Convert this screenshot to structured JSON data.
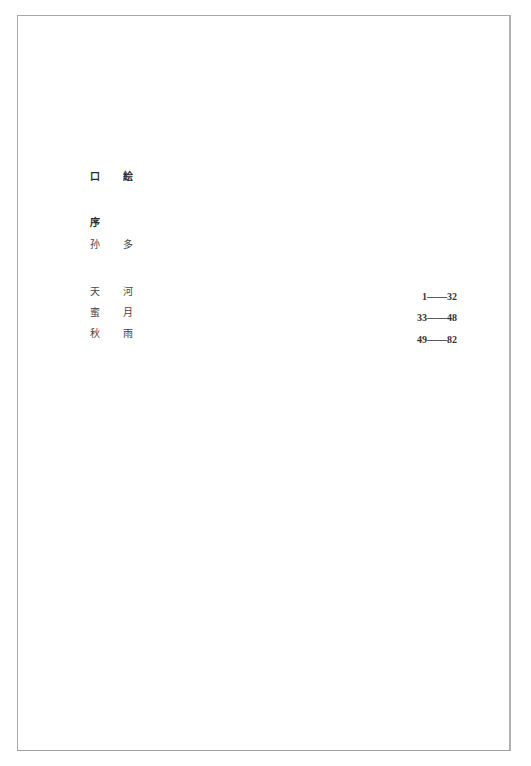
{
  "document": {
    "type": "table-of-contents",
    "front_matter": [
      {
        "label": "口 絵"
      },
      {
        "label": "序"
      },
      {
        "label": "孙 多"
      }
    ],
    "entries": [
      {
        "title": "天 河",
        "pages": "1——32"
      },
      {
        "title": "蜜 月",
        "pages": "33——48"
      },
      {
        "title": "秋 雨",
        "pages": "49——82"
      }
    ]
  }
}
